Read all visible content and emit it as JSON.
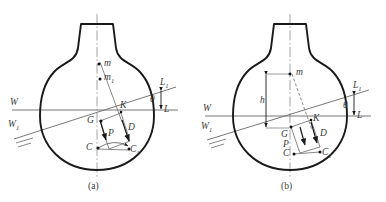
{
  "figure": {
    "type": "naval-architecture-stability-diagram",
    "background_color": "#ffffff",
    "hull_outline_color": "#1a1a1a",
    "line_color": "#6b6b6b",
    "label_color": "#3a3a3a",
    "width": 386,
    "height": 202
  },
  "panels": [
    {
      "id": "a",
      "caption": "(a)",
      "caption_x": 88,
      "caption_y": 183,
      "origin_x": 0,
      "waterlines": {
        "upright_left_label": "W",
        "upright_right_label": "L",
        "heeled_left_label": "W",
        "heeled_left_sub": "1",
        "heeled_right_label": "L",
        "heeled_right_sub": "1",
        "angle_label": "θ"
      },
      "points": [
        {
          "name": "m",
          "label": "m",
          "sub": "",
          "x": 98,
          "y": 64,
          "dot": true
        },
        {
          "name": "m1",
          "label": "m",
          "sub": "1",
          "x": 96,
          "y": 78,
          "dot": true
        },
        {
          "name": "K",
          "label": "K",
          "sub": "",
          "x": 117,
          "y": 107,
          "dot": false
        },
        {
          "name": "G",
          "label": "G",
          "sub": "",
          "x": 96,
          "y": 122,
          "dot": true
        },
        {
          "name": "D",
          "label": "D",
          "sub": "",
          "x": 124,
          "y": 128,
          "dot": false
        },
        {
          "name": "P",
          "label": "P",
          "sub": "",
          "x": 108,
          "y": 132,
          "dot": false
        },
        {
          "name": "C",
          "label": "C",
          "sub": "",
          "x": 92,
          "y": 148,
          "dot": true
        },
        {
          "name": "C1",
          "label": "C",
          "sub": "1",
          "x": 124,
          "y": 150,
          "dot": true
        }
      ]
    },
    {
      "id": "b",
      "caption": "(b)",
      "caption_x": 281,
      "caption_y": 183,
      "origin_x": 193,
      "waterlines": {
        "upright_left_label": "W",
        "upright_right_label": "L",
        "heeled_left_label": "W",
        "heeled_left_sub": "1",
        "heeled_right_label": "L",
        "heeled_right_sub": "1",
        "angle_label": "θ"
      },
      "dimension": {
        "label": "h",
        "x": 273,
        "y": 100
      },
      "points": [
        {
          "name": "m",
          "label": "m",
          "sub": "",
          "x": 293,
          "y": 73,
          "dot": true
        },
        {
          "name": "K",
          "label": "K",
          "sub": "",
          "x": 310,
          "y": 118,
          "dot": false
        },
        {
          "name": "G",
          "label": "G",
          "sub": "",
          "x": 287,
          "y": 128,
          "dot": true
        },
        {
          "name": "D",
          "label": "D",
          "sub": "",
          "x": 315,
          "y": 130,
          "dot": false
        },
        {
          "name": "P",
          "label": "P",
          "sub": "",
          "x": 288,
          "y": 141,
          "dot": false
        },
        {
          "name": "C",
          "label": "C",
          "sub": "",
          "x": 288,
          "y": 153,
          "dot": true
        },
        {
          "name": "C1",
          "label": "C",
          "sub": "1",
          "x": 317,
          "y": 152,
          "dot": true
        }
      ]
    }
  ]
}
